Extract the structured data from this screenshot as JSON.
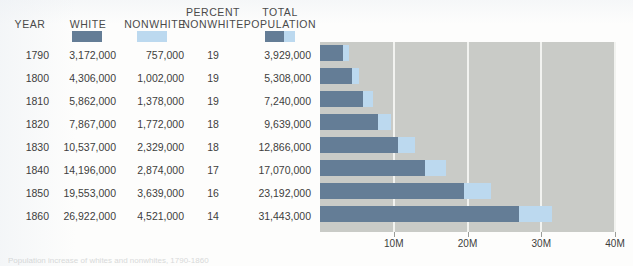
{
  "figure": {
    "caption_partial": "Population increase of whites and nonwhites, 1790-1860"
  },
  "table": {
    "columns": [
      {
        "label": "YEAR",
        "lines": [
          "YEAR"
        ],
        "swatch": null
      },
      {
        "label": "WHITE",
        "lines": [
          "WHITE"
        ],
        "swatch": "white"
      },
      {
        "label": "NONWHITE",
        "lines": [
          "NONWHITE"
        ],
        "swatch": "nonwhite"
      },
      {
        "label": "PERCENT NONWHITE",
        "lines": [
          "PERCENT",
          "NONWHITE"
        ],
        "swatch": null
      },
      {
        "label": "TOTAL POPULATION",
        "lines": [
          "TOTAL",
          "POPULATION"
        ],
        "swatch": "total"
      }
    ],
    "rows": [
      {
        "year": "1790",
        "white": "3,172,000",
        "nonwhite": "757,000",
        "percent_nonwhite": "19",
        "total": "3,929,000"
      },
      {
        "year": "1800",
        "white": "4,306,000",
        "nonwhite": "1,002,000",
        "percent_nonwhite": "19",
        "total": "5,308,000"
      },
      {
        "year": "1810",
        "white": "5,862,000",
        "nonwhite": "1,378,000",
        "percent_nonwhite": "19",
        "total": "7,240,000"
      },
      {
        "year": "1820",
        "white": "7,867,000",
        "nonwhite": "1,772,000",
        "percent_nonwhite": "18",
        "total": "9,639,000"
      },
      {
        "year": "1830",
        "white": "10,537,000",
        "nonwhite": "2,329,000",
        "percent_nonwhite": "18",
        "total": "12,866,000"
      },
      {
        "year": "1840",
        "white": "14,196,000",
        "nonwhite": "2,874,000",
        "percent_nonwhite": "17",
        "total": "17,070,000"
      },
      {
        "year": "1850",
        "white": "19,553,000",
        "nonwhite": "3,639,000",
        "percent_nonwhite": "16",
        "total": "23,192,000"
      },
      {
        "year": "1860",
        "white": "26,922,000",
        "nonwhite": "4,521,000",
        "percent_nonwhite": "14",
        "total": "31,443,000"
      }
    ]
  },
  "colors": {
    "white_series": "#647d96",
    "nonwhite_series": "#bcd9ef",
    "plot_background": "#c9cbc7",
    "gridline": "#f2f3f0",
    "page_background": "#fdfdfc",
    "text": "#3d3d3d"
  },
  "chart_data": {
    "type": "bar",
    "orientation": "horizontal",
    "stacked": true,
    "title": "",
    "xlabel": "",
    "ylabel": "",
    "categories": [
      "1790",
      "1800",
      "1810",
      "1820",
      "1830",
      "1840",
      "1850",
      "1860"
    ],
    "series": [
      {
        "name": "WHITE",
        "color": "#647d96",
        "values": [
          3172000,
          4306000,
          5862000,
          7867000,
          10537000,
          14196000,
          19553000,
          26922000
        ]
      },
      {
        "name": "NONWHITE",
        "color": "#bcd9ef",
        "values": [
          757000,
          1002000,
          1378000,
          1772000,
          2329000,
          2874000,
          3639000,
          4521000
        ]
      }
    ],
    "totals": [
      3929000,
      5308000,
      7240000,
      9639000,
      12866000,
      17070000,
      23192000,
      31443000
    ],
    "xlim": [
      0,
      40000000
    ],
    "xticks": [
      10000000,
      20000000,
      30000000,
      40000000
    ],
    "xticklabels": [
      "10M",
      "20M",
      "30M",
      "40M"
    ],
    "grid": true,
    "legend": "swatches in table column headers"
  }
}
